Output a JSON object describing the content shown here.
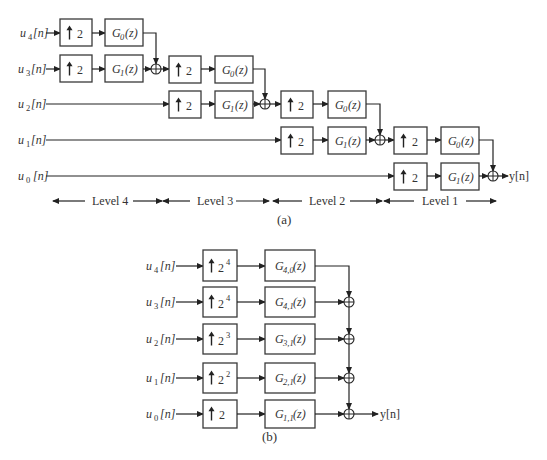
{
  "figure_a": {
    "caption": "(a)",
    "inputs": [
      {
        "name": "u",
        "sub": "4",
        "suffix": "[n]"
      },
      {
        "name": "u",
        "sub": "3",
        "suffix": "[n]"
      },
      {
        "name": "u",
        "sub": "2",
        "suffix": "[n]"
      },
      {
        "name": "u",
        "sub": "1",
        "suffix": "[n]"
      },
      {
        "name": "u",
        "sub": "0",
        "suffix": "[n]"
      }
    ],
    "upsampler_label": "2",
    "filters": {
      "g0": {
        "name": "G",
        "sub": "0",
        "arg": "(z)"
      },
      "g1": {
        "name": "G",
        "sub": "1",
        "arg": "(z)"
      }
    },
    "output": "y[n]",
    "levels": [
      "Level  4",
      "Level  3",
      "Level  2",
      "Level  1"
    ]
  },
  "figure_b": {
    "caption": "(b)",
    "rows": [
      {
        "input_sub": "4",
        "up_base": "2",
        "up_exp": "4",
        "filter_sub": "4,0"
      },
      {
        "input_sub": "3",
        "up_base": "2",
        "up_exp": "4",
        "filter_sub": "4,1"
      },
      {
        "input_sub": "2",
        "up_base": "2",
        "up_exp": "3",
        "filter_sub": "3,1"
      },
      {
        "input_sub": "1",
        "up_base": "2",
        "up_exp": "2",
        "filter_sub": "2,1"
      },
      {
        "input_sub": "0",
        "up_base": "2",
        "up_exp": "",
        "filter_sub": "1,1"
      }
    ],
    "input_name": "u",
    "input_suffix": "[n]",
    "filter_name": "G",
    "filter_arg": "(z)",
    "output": "y[n]"
  }
}
